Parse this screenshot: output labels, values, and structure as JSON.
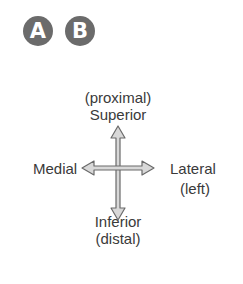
{
  "badges": [
    {
      "letter": "A"
    },
    {
      "letter": "B"
    }
  ],
  "diagram": {
    "top": {
      "line1": "(proximal)",
      "line2": "Superior"
    },
    "bottom": {
      "line1": "Inferior",
      "line2": "(distal)"
    },
    "left": {
      "label": "Medial"
    },
    "right": {
      "line1": "Lateral",
      "line2": "(left)"
    }
  },
  "colors": {
    "badge": "#6b6b6b",
    "arrow_fill": "#d8d8d8",
    "arrow_stroke": "#6a6a6a",
    "text": "#3a3a3a"
  }
}
